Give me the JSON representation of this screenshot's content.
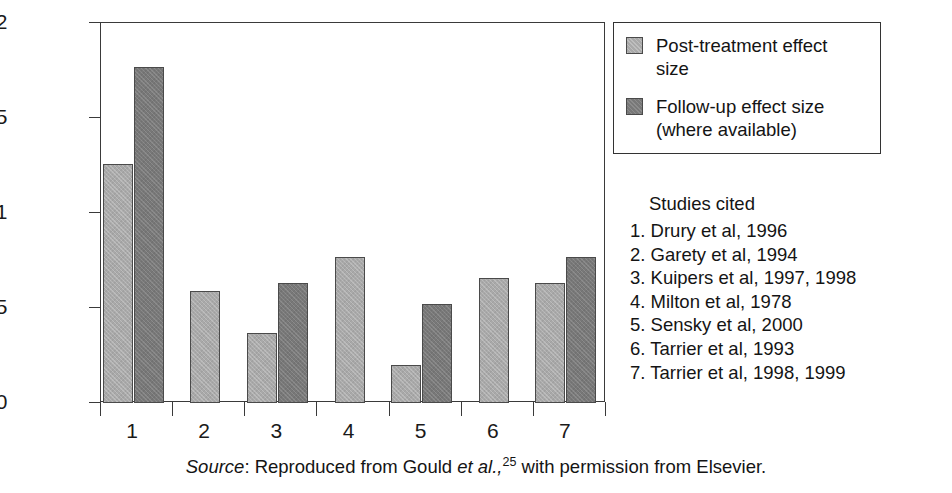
{
  "chart_data": {
    "type": "bar",
    "title": "",
    "xlabel": "",
    "ylabel": "",
    "ylim": [
      0,
      2
    ],
    "yticks": [
      0,
      0.5,
      1,
      1.5,
      2
    ],
    "ytick_labels": [
      "0",
      "0. 5",
      "1",
      "1. 5",
      "2"
    ],
    "grid": false,
    "legend_position": "top-right",
    "categories": [
      "1",
      "2",
      "3",
      "4",
      "5",
      "6",
      "7"
    ],
    "series": [
      {
        "name": "Post-treatment effect size",
        "color": "#a9a9a9",
        "values": [
          1.26,
          0.59,
          0.37,
          0.77,
          0.2,
          0.66,
          0.63
        ]
      },
      {
        "name": "Follow-up effect size (where available)",
        "color": "#787878",
        "values": [
          1.77,
          null,
          0.63,
          null,
          0.52,
          null,
          0.77
        ]
      }
    ]
  },
  "legend": {
    "items": [
      {
        "swatch": "post",
        "label": "Post-treatment effect\nsize"
      },
      {
        "swatch": "follow",
        "label": "Follow-up effect size\n(where available)"
      }
    ]
  },
  "studies": {
    "title": "Studies cited",
    "items": [
      "1. Drury et al, 1996",
      "2. Garety et al, 1994",
      "3. Kuipers et al, 1997, 1998",
      "4. Milton et al, 1978",
      "5. Sensky et al, 2000",
      "6. Tarrier et al, 1993",
      "7. Tarrier et al, 1998, 1999"
    ]
  },
  "source": {
    "label": "Source",
    "colon": ": ",
    "text_before": "Reproduced from Gould ",
    "italic_etal": "et al.,",
    "superscript": "25",
    "text_after": " with permission from Elsevier."
  }
}
